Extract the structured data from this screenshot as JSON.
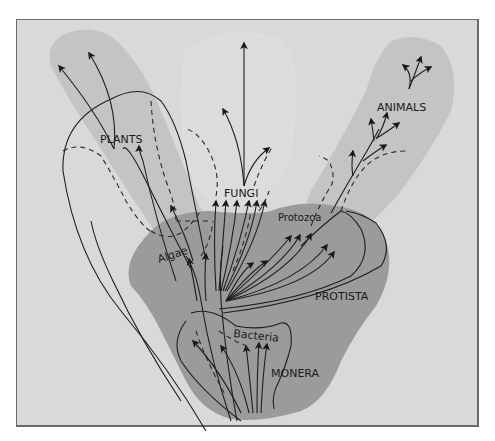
{
  "figure": {
    "type": "phylogenetic-tree",
    "colors": {
      "background": "#d9d9d9",
      "light_region": "#c4c4c4",
      "dark_region": "#9b9b9b",
      "line": "#1e1e1e",
      "frame": "#6a6a6a"
    }
  },
  "labels": {
    "plants": "PLANTS",
    "fungi": "FUNGI",
    "animals": "ANIMALS",
    "algae": "Algae",
    "protozoa": "Protozoa",
    "protista": "PROTISTA",
    "bacteria": "Bacteria",
    "monera": "MONERA"
  },
  "regions": [
    {
      "name": "Plants",
      "shade": "light"
    },
    {
      "name": "Fungi",
      "shade": "lighter"
    },
    {
      "name": "Animals",
      "shade": "light"
    },
    {
      "name": "Protista",
      "shade": "dark"
    },
    {
      "name": "Monera",
      "shade": "dark"
    }
  ]
}
